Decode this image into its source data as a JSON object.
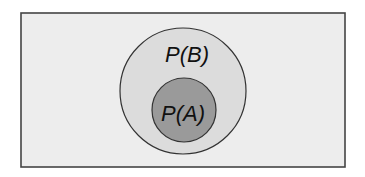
{
  "diagram": {
    "type": "venn-subset",
    "universe": {
      "x": 21,
      "y": 13,
      "width": 324,
      "height": 154,
      "fill": "#ededed",
      "stroke": "#444444"
    },
    "outer_set": {
      "label": "P(B)",
      "cx": 183,
      "cy": 91,
      "r": 63,
      "fill": "#dcdcdc",
      "stroke": "#333333",
      "label_x": 187,
      "label_y": 62
    },
    "inner_set": {
      "label": "P(A)",
      "cx": 184,
      "cy": 110,
      "r": 32,
      "fill": "#9a9a9a",
      "stroke": "#333333",
      "label_x": 183,
      "label_y": 121
    }
  }
}
